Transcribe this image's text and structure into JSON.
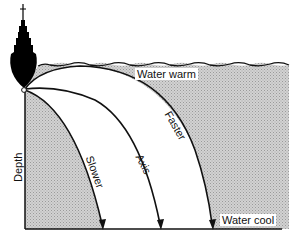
{
  "diagram": {
    "labels": {
      "water_warm": "Water warm",
      "water_cool": "Water cool",
      "depth": "Depth",
      "slower": "Slower",
      "axis": "Axis",
      "faster": "Faster"
    },
    "colors": {
      "shading": "#c8c8c8",
      "line": "#111111",
      "ship": "#000000",
      "background": "#ffffff"
    },
    "elements": [
      "ship",
      "water-surface",
      "sound-source",
      "ray-slower",
      "ray-axis",
      "ray-faster",
      "depth-axis",
      "bottom-line"
    ]
  }
}
